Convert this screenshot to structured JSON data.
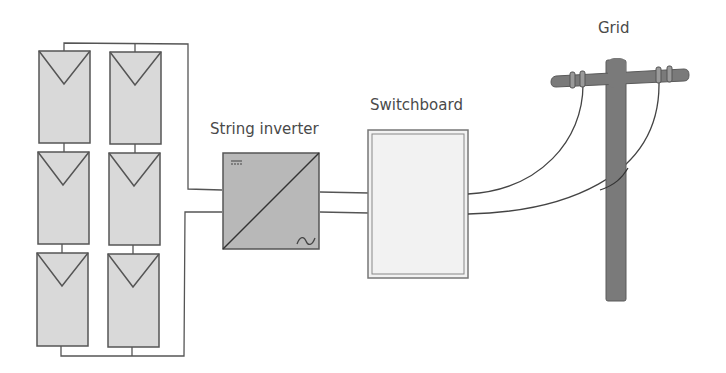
{
  "diagram": {
    "labels": {
      "inverter": "String inverter",
      "switchboard": "Switchboard",
      "grid": "Grid"
    },
    "solar_array": {
      "columns": 2,
      "rows": 3,
      "panel_count": 6
    },
    "inverter_symbols": {
      "dc": "DC (=)",
      "ac": "AC (~)"
    },
    "colors": {
      "panel_fill": "#d9d9d9",
      "panel_stroke": "#555555",
      "inverter_fill": "#b8b8b8",
      "switchboard_fill": "#f2f2f2",
      "pole_fill": "#7a7a7a",
      "wire": "#444444",
      "text": "#4a4a4a"
    }
  }
}
